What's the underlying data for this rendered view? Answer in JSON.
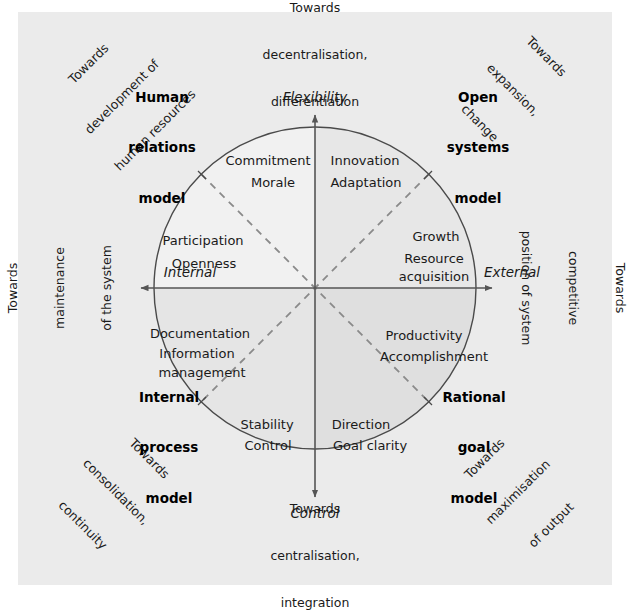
{
  "figure": {
    "type": "quadrant-diagram",
    "background_color": "#ebebeb",
    "page_color": "#ffffff"
  },
  "axes": {
    "vertical": {
      "top_label": "Flexibility",
      "bottom_label": "Control",
      "top_caption": "Towards\ndecentralisation,\ndifferentiation",
      "bottom_caption": "Towards\ncentralisation,\nintegration"
    },
    "horizontal": {
      "left_label": "Internal",
      "right_label": "External",
      "left_caption": "Towards\nmaintenance\nof the system",
      "right_caption": "Towards\ncompetitive\nposition of system"
    }
  },
  "quadrants": [
    {
      "id": "human-relations",
      "model": "Human\nrelations\nmodel",
      "diagonal_caption": "Towards\ndevelopment of\nhuman resources",
      "position": "top-left",
      "fill": "#f0f0f0",
      "means": "Participation\n\nOpenness",
      "ends": "Commitment\n\nMorale",
      "inner_upper": [
        "Commitment",
        "Morale"
      ],
      "inner_lower": [
        "Participation",
        "Openness"
      ]
    },
    {
      "id": "open-systems",
      "model": "Open\nsystems\nmodel",
      "diagonal_caption": "Towards\nexpansion,\nchange",
      "position": "top-right",
      "fill": "#e6e6e6",
      "means": "Innovation\n\nAdaptation",
      "ends": "Growth\n\nResource acquisition",
      "inner_upper": [
        "Innovation",
        "Adaptation"
      ],
      "inner_lower": [
        "Growth",
        "Resource",
        "acquisition"
      ]
    },
    {
      "id": "internal-process",
      "model": "Internal\nprocess\nmodel",
      "diagonal_caption": "Towards\nconsolidation,\ncontinuity",
      "position": "bottom-left",
      "fill": "#e4e4e4",
      "means": "Documentation\n\nInformation management",
      "ends": "Stability\n\nControl",
      "inner_upper": [
        "Documentation",
        "Information",
        "management"
      ],
      "inner_lower": [
        "Stability",
        "Control"
      ]
    },
    {
      "id": "rational-goal",
      "model": "Rational\ngoal\nmodel",
      "diagonal_caption": "Towards\nmaximisation\nof output",
      "position": "bottom-right",
      "fill": "#dedede",
      "means": "Direction\n\nGoal clarity",
      "ends": "Productivity\n\nAccomplishment",
      "inner_upper": [
        "Productivity",
        "Accomplishment"
      ],
      "inner_lower": [
        "Direction",
        "Goal clarity"
      ]
    }
  ],
  "inner_labels": {
    "commitment": "Commitment",
    "morale": "Morale",
    "participation": "Participation",
    "openness": "Openness",
    "innovation": "Innovation",
    "adaptation": "Adaptation",
    "growth": "Growth",
    "resource": "Resource",
    "acquisition": "acquisition",
    "documentation": "Documentation",
    "information": "Information",
    "management": "management",
    "stability": "Stability",
    "control_inner": "Control",
    "productivity": "Productivity",
    "accomplishment": "Accomplishment",
    "direction": "Direction",
    "goal_clarity": "Goal clarity"
  },
  "model_names": {
    "human_relations_1": "Human",
    "human_relations_2": "relations",
    "human_relations_3": "model",
    "open_systems_1": "Open",
    "open_systems_2": "systems",
    "open_systems_3": "model",
    "internal_process_1": "Internal",
    "internal_process_2": "process",
    "internal_process_3": "model",
    "rational_goal_1": "Rational",
    "rational_goal_2": "goal",
    "rational_goal_3": "model"
  },
  "towards": {
    "top_1": "Towards",
    "top_2": "decentralisation,",
    "top_3": "differentiation",
    "bottom_1": "Towards",
    "bottom_2": "centralisation,",
    "bottom_3": "integration",
    "left_1": "Towards",
    "left_2": "maintenance",
    "left_3": "of the system",
    "right_1": "Towards",
    "right_2": "competitive",
    "right_3": "position of system",
    "tl_1": "Towards",
    "tl_2": "development of",
    "tl_3": "human resources",
    "tr_1": "Towards",
    "tr_2": "expansion,",
    "tr_3": "change",
    "bl_1": "Towards",
    "bl_2": "consolidation,",
    "bl_3": "continuity",
    "br_1": "Towards",
    "br_2": "maximisation",
    "br_3": "of output"
  },
  "axis_names": {
    "flexibility": "Flexibility",
    "control": "Control",
    "internal": "Internal",
    "external": "External"
  },
  "geometry": {
    "center_x": 315,
    "center_y": 288,
    "radius": 161,
    "line_color": "#555555",
    "dash_color": "#808080"
  }
}
